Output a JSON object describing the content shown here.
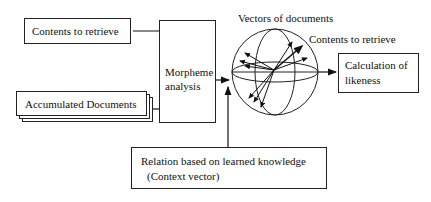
{
  "diagram": {
    "nodes": {
      "contents_input": {
        "label": "Contents to retrieve"
      },
      "accumulated_docs": {
        "label": "Accumulated Documents"
      },
      "morpheme": {
        "line1": "Morpheme",
        "line2": "analysis"
      },
      "calculation": {
        "line1": "Calculation of",
        "line2": "likeness"
      },
      "relation": {
        "line1": "Relation based on learned knowledge",
        "line2": "(Context vector)"
      }
    },
    "sphere_labels": {
      "vectors_of_documents": "Vectors of documents",
      "contents_to_retrieve": "Contents to retrieve"
    },
    "edges": [
      {
        "from": "contents_input",
        "to": "morpheme"
      },
      {
        "from": "accumulated_docs",
        "to": "morpheme"
      },
      {
        "from": "morpheme",
        "to": "vector_space"
      },
      {
        "from": "relation",
        "to": "vector_space"
      },
      {
        "from": "vector_space",
        "to": "calculation"
      }
    ],
    "colors": {
      "stroke": "#222222",
      "background": "#ffffff"
    }
  }
}
